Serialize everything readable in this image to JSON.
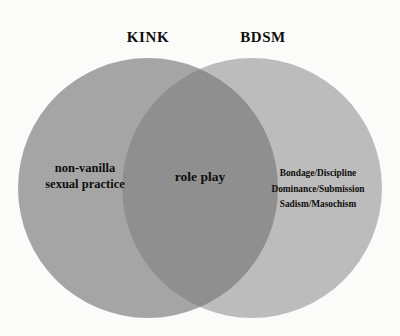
{
  "diagram": {
    "type": "venn",
    "background_color": "#fbfbfa",
    "headings": {
      "left": "KINK",
      "right": "BDSM"
    },
    "sets": [
      {
        "name": "KINK",
        "position": "left",
        "fill_color": "#a5a5a5",
        "label_lines": [
          "non-vanilla",
          "sexual practice"
        ]
      },
      {
        "name": "BDSM",
        "position": "right",
        "fill_color": "#bcbcbc",
        "label_lines": [
          "Bondage/Discipline",
          "Dominance/Submission",
          "Sadism/Masochism"
        ]
      }
    ],
    "intersection": {
      "fill_color": "#8f8f8f",
      "label": "role play"
    },
    "text_color": "#0f0e0c"
  }
}
